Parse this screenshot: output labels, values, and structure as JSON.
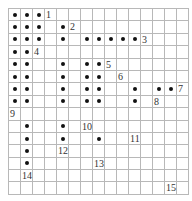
{
  "grid": {
    "cols": 15,
    "rows": 15,
    "line_color": "#b8b8b8",
    "dot_color": "#111111",
    "dots": [
      [
        0,
        0
      ],
      [
        0,
        1
      ],
      [
        0,
        2
      ],
      [
        1,
        0
      ],
      [
        1,
        1
      ],
      [
        1,
        2
      ],
      [
        1,
        4
      ],
      [
        2,
        0
      ],
      [
        2,
        1
      ],
      [
        2,
        2
      ],
      [
        2,
        4
      ],
      [
        2,
        6
      ],
      [
        2,
        7
      ],
      [
        2,
        8
      ],
      [
        2,
        9
      ],
      [
        2,
        10
      ],
      [
        3,
        0
      ],
      [
        3,
        1
      ],
      [
        4,
        0
      ],
      [
        4,
        1
      ],
      [
        4,
        4
      ],
      [
        4,
        6
      ],
      [
        4,
        7
      ],
      [
        5,
        0
      ],
      [
        5,
        1
      ],
      [
        5,
        4
      ],
      [
        5,
        6
      ],
      [
        5,
        7
      ],
      [
        6,
        0
      ],
      [
        6,
        1
      ],
      [
        6,
        4
      ],
      [
        6,
        6
      ],
      [
        6,
        7
      ],
      [
        6,
        10
      ],
      [
        6,
        12
      ],
      [
        6,
        13
      ],
      [
        7,
        0
      ],
      [
        7,
        1
      ],
      [
        7,
        4
      ],
      [
        7,
        6
      ],
      [
        7,
        7
      ],
      [
        7,
        10
      ],
      [
        9,
        1
      ],
      [
        9,
        4
      ],
      [
        10,
        1
      ],
      [
        10,
        4
      ],
      [
        10,
        7
      ],
      [
        11,
        1
      ],
      [
        12,
        1
      ]
    ],
    "labels": [
      {
        "row": 0,
        "col": 3,
        "text": "1"
      },
      {
        "row": 1,
        "col": 5,
        "text": "2"
      },
      {
        "row": 2,
        "col": 11,
        "text": "3"
      },
      {
        "row": 3,
        "col": 2,
        "text": "4"
      },
      {
        "row": 4,
        "col": 8,
        "text": "5"
      },
      {
        "row": 5,
        "col": 9,
        "text": "6"
      },
      {
        "row": 6,
        "col": 14,
        "text": "7"
      },
      {
        "row": 7,
        "col": 12,
        "text": "8"
      },
      {
        "row": 8,
        "col": 0,
        "text": "9"
      },
      {
        "row": 9,
        "col": 6,
        "text": "10"
      },
      {
        "row": 10,
        "col": 10,
        "text": "11"
      },
      {
        "row": 11,
        "col": 4,
        "text": "12"
      },
      {
        "row": 12,
        "col": 7,
        "text": "13"
      },
      {
        "row": 13,
        "col": 1,
        "text": "14"
      },
      {
        "row": 14,
        "col": 13,
        "text": "15"
      }
    ]
  }
}
